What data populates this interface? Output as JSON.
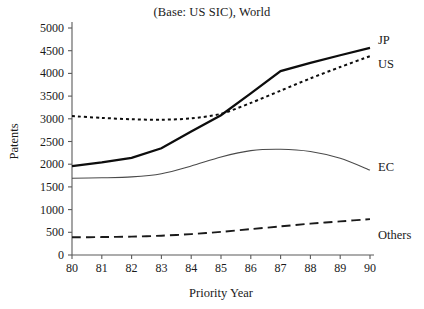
{
  "chart_data": {
    "type": "line",
    "title": "(Base: US SIC), World",
    "xlabel": "Priority Year",
    "ylabel": "Patents",
    "x": [
      80,
      81,
      82,
      83,
      84,
      85,
      86,
      87,
      88,
      89,
      90
    ],
    "xtick_labels": [
      "80",
      "81",
      "82",
      "83",
      "84",
      "85",
      "86",
      "87",
      "88",
      "89",
      "90"
    ],
    "ytick_labels": [
      "0",
      "500",
      "1000",
      "1500",
      "2000",
      "2500",
      "3000",
      "3500",
      "4000",
      "4500",
      "5000"
    ],
    "ytick_values": [
      0,
      500,
      1000,
      1500,
      2000,
      2500,
      3000,
      3500,
      4000,
      4500,
      5000
    ],
    "xlim": [
      80,
      90
    ],
    "ylim": [
      0,
      5000
    ],
    "grid": false,
    "legend_position": "right-inline",
    "series": [
      {
        "name": "JP",
        "label": "JP",
        "style": "solid-thick",
        "color": "#0d0d0d",
        "values": [
          1960,
          2040,
          2140,
          2350,
          2720,
          3080,
          3560,
          4050,
          4230,
          4400,
          4560
        ]
      },
      {
        "name": "US",
        "label": "US",
        "style": "dotted",
        "color": "#0d0d0d",
        "values": [
          3060,
          3020,
          2990,
          2980,
          3010,
          3110,
          3350,
          3620,
          3890,
          4140,
          4380
        ]
      },
      {
        "name": "EC",
        "label": "EC",
        "style": "solid-thin",
        "color": "#4a4a4a",
        "values": [
          1690,
          1700,
          1720,
          1790,
          1960,
          2160,
          2300,
          2330,
          2280,
          2130,
          1870
        ]
      },
      {
        "name": "Others",
        "label": "Others",
        "style": "dashed",
        "color": "#1a1a1a",
        "values": [
          390,
          395,
          405,
          425,
          460,
          510,
          570,
          630,
          690,
          740,
          790
        ]
      }
    ]
  }
}
